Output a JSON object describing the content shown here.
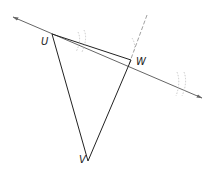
{
  "diagram": {
    "title": "",
    "points": [
      {
        "id": "U",
        "label": "U",
        "x": 52,
        "y": 34
      },
      {
        "id": "W",
        "label": "W",
        "x": 130,
        "y": 61
      },
      {
        "id": "V",
        "label": "V",
        "x": 88,
        "y": 161
      }
    ],
    "colors": {
      "line": "#666666",
      "triangle": "#222222",
      "construction": "#bbbbbb"
    }
  }
}
